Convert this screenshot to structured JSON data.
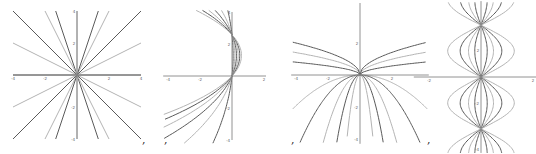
{
  "figure": {
    "separator": ",",
    "colors": {
      "dark": "#5a5a5a",
      "light": "#b4b4b4",
      "axis": "#777777"
    },
    "plots": [
      {
        "name": "radial-lines",
        "family": "y = k x",
        "x_ticks": [
          "-4",
          "-2",
          "2",
          "4"
        ],
        "y_ticks": [
          "4",
          "2",
          "-2",
          "-4"
        ],
        "params": [
          -3,
          -2,
          -1,
          -0.5,
          0,
          0.5,
          1,
          2,
          3,
          "vertical"
        ]
      },
      {
        "name": "left-parabolas",
        "family": "x = a y^2 + b y",
        "x_ticks": [
          "-4",
          "-2",
          "2"
        ],
        "y_ticks": [
          "4",
          "2",
          "-2",
          "-4"
        ],
        "params": [
          0.2,
          0.5,
          0.8,
          1.1,
          1.4,
          1.7
        ]
      },
      {
        "name": "half-parabolas",
        "family": "y = c sqrt|x| / -c x^2",
        "x_ticks": [
          "-4",
          "-2",
          "2"
        ],
        "y_ticks": [
          "2",
          "-2",
          "-4"
        ],
        "params": [
          0.4,
          0.7,
          1.0
        ]
      },
      {
        "name": "sine-lobes",
        "family": "x = a sin(y)",
        "x_ticks": [
          "-2",
          "2"
        ],
        "y_ticks": [
          "2",
          "-2",
          "-4"
        ],
        "params": [
          0.3,
          0.6,
          1.0,
          1.6
        ]
      }
    ]
  }
}
